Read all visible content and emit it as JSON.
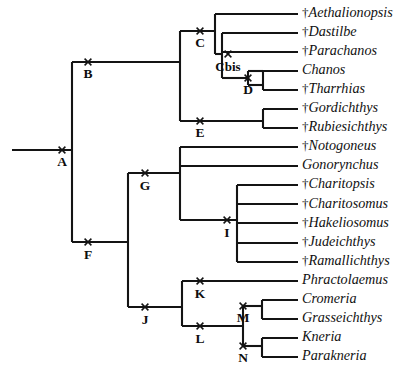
{
  "figure": {
    "type": "cladogram",
    "background_color": "#ffffff",
    "line_color": "#141414",
    "text_color": "#111111",
    "extinct_marker": "†",
    "extinct_marker_name": "dagger-icon",
    "node_marker": "x",
    "node_marker_name": "x-cross-icon",
    "tip_label_x": 302,
    "tip_line_end_x": 298,
    "first_tip_y": 14,
    "tip_spacing": 19.05
  },
  "taxa": [
    {
      "id": "aethalionopsis",
      "name": "Aethalionopsis",
      "extinct": true,
      "row": 0,
      "branch_x": 215
    },
    {
      "id": "dastilbe",
      "name": "Dastilbe",
      "extinct": true,
      "row": 1,
      "branch_x": 222
    },
    {
      "id": "parachanos",
      "name": "Parachanos",
      "extinct": true,
      "row": 2,
      "branch_x": 222
    },
    {
      "id": "chanos",
      "name": "Chanos",
      "extinct": false,
      "row": 3,
      "branch_x": 263
    },
    {
      "id": "tharrhias",
      "name": "Tharrhias",
      "extinct": true,
      "row": 4,
      "branch_x": 263
    },
    {
      "id": "gordichthys",
      "name": "Gordichthys",
      "extinct": true,
      "row": 5,
      "branch_x": 263
    },
    {
      "id": "rubiesichthys",
      "name": "Rubiesichthys",
      "extinct": true,
      "row": 6,
      "branch_x": 263
    },
    {
      "id": "notogoneus",
      "name": "Notogoneus",
      "extinct": true,
      "row": 7,
      "branch_x": 180
    },
    {
      "id": "gonorynchus",
      "name": "Gonorynchus",
      "extinct": false,
      "row": 8,
      "branch_x": 180
    },
    {
      "id": "charitopsis",
      "name": "Charitopsis",
      "extinct": true,
      "row": 9,
      "branch_x": 237
    },
    {
      "id": "charitosomus",
      "name": "Charitosomus",
      "extinct": true,
      "row": 10,
      "branch_x": 237
    },
    {
      "id": "hakeliosomus",
      "name": "Hakeliosomus",
      "extinct": true,
      "row": 11,
      "branch_x": 237
    },
    {
      "id": "judeichthys",
      "name": "Judeichthys",
      "extinct": true,
      "row": 12,
      "branch_x": 237
    },
    {
      "id": "ramallichthys",
      "name": "Ramallichthys",
      "extinct": true,
      "row": 13,
      "branch_x": 237
    },
    {
      "id": "phractolaemus",
      "name": "Phractolaemus",
      "extinct": false,
      "row": 14,
      "branch_x": 182
    },
    {
      "id": "cromeria",
      "name": "Cromeria",
      "extinct": false,
      "row": 15,
      "branch_x": 262
    },
    {
      "id": "grasseichthys",
      "name": "Grasseichthys",
      "extinct": false,
      "row": 16,
      "branch_x": 262
    },
    {
      "id": "kneria",
      "name": "Kneria",
      "extinct": false,
      "row": 17,
      "branch_x": 262
    },
    {
      "id": "parakneria",
      "name": "Parakneria",
      "extinct": false,
      "row": 18,
      "branch_x": 262
    }
  ],
  "nodes": [
    {
      "id": "A",
      "label": "A",
      "x": 72,
      "y": 150,
      "mark_x": 62,
      "label_dx": 0,
      "label_dy": 16
    },
    {
      "id": "B",
      "label": "B",
      "x": 72,
      "y": 62,
      "mark_x": 88,
      "label_dx": 16,
      "label_dy": 16
    },
    {
      "id": "C",
      "label": "C",
      "x": 180,
      "y": 31,
      "mark_x": 200,
      "label_dx": 20,
      "label_dy": 16
    },
    {
      "id": "Cbis",
      "label": "Cbis",
      "x": 222,
      "y": 54,
      "mark_x": 228,
      "label_dx": 6,
      "label_dy": 17,
      "wide": true
    },
    {
      "id": "D",
      "label": "D",
      "x": 248,
      "y": 78,
      "mark_x": 248,
      "label_dx": 0,
      "label_dy": 16
    },
    {
      "id": "E",
      "label": "E",
      "x": 180,
      "y": 121,
      "mark_x": 200,
      "label_dx": 20,
      "label_dy": 16
    },
    {
      "id": "F",
      "label": "F",
      "x": 128,
      "y": 242,
      "mark_x": 88,
      "label_dx": -40,
      "label_dy": 17
    },
    {
      "id": "G",
      "label": "G",
      "x": 145,
      "y": 173,
      "mark_x": 145,
      "label_dx": 0,
      "label_dy": 17
    },
    {
      "id": "I",
      "label": "I",
      "x": 237,
      "y": 220,
      "mark_x": 227,
      "label_dx": -10,
      "label_dy": 17
    },
    {
      "id": "J",
      "label": "J",
      "x": 145,
      "y": 307,
      "mark_x": 145,
      "label_dx": 0,
      "label_dy": 17
    },
    {
      "id": "K",
      "label": "K",
      "x": 182,
      "y": 281,
      "mark_x": 200,
      "label_dx": 18,
      "label_dy": 17
    },
    {
      "id": "L",
      "label": "L",
      "x": 182,
      "y": 326,
      "mark_x": 200,
      "label_dx": 18,
      "label_dy": 17
    },
    {
      "id": "M",
      "label": "M",
      "x": 243,
      "y": 306,
      "mark_x": 243,
      "label_dx": 0,
      "label_dy": 16
    },
    {
      "id": "N",
      "label": "N",
      "x": 243,
      "y": 346,
      "mark_x": 243,
      "label_dx": 0,
      "label_dy": 16
    }
  ],
  "edges": [
    {
      "id": "root-stem",
      "from": "root",
      "to": "A",
      "type": "h",
      "x1": 12,
      "x2": 72,
      "y": 150
    },
    {
      "id": "A-vertical",
      "from": "A",
      "to": "B-F",
      "type": "v",
      "x": 72,
      "y1": 62,
      "y2": 242
    },
    {
      "id": "B-stem",
      "from": "A",
      "to": "B",
      "type": "h",
      "x1": 72,
      "x2": 180,
      "y": 62
    },
    {
      "id": "B-vertical",
      "from": "B",
      "to": "C-E",
      "type": "v",
      "x": 180,
      "y1": 31,
      "y2": 121
    },
    {
      "id": "C-stem",
      "from": "B",
      "to": "C",
      "type": "h",
      "x1": 180,
      "x2": 215,
      "y": 31
    },
    {
      "id": "C-vertical",
      "from": "C",
      "to": "kids",
      "type": "v",
      "x": 215,
      "y1": 14,
      "y2": 54
    },
    {
      "id": "aethalionopsis-branch",
      "from": "C",
      "to": "aethalionopsis",
      "type": "h",
      "x1": 215,
      "x2": 298,
      "y": 14
    },
    {
      "id": "Cbis-stem",
      "from": "C",
      "to": "Cbis",
      "type": "h",
      "x1": 215,
      "x2": 222,
      "y": 54
    },
    {
      "id": "Cbis-vertical",
      "from": "Cbis",
      "to": "kids",
      "type": "v",
      "x": 222,
      "y1": 33,
      "y2": 78
    },
    {
      "id": "dastilbe-branch",
      "from": "Cbis",
      "to": "dastilbe",
      "type": "h",
      "x1": 222,
      "x2": 298,
      "y": 33
    },
    {
      "id": "parachanos-branch",
      "from": "Cbis",
      "to": "parachanos",
      "type": "h",
      "x1": 222,
      "x2": 298,
      "y": 52
    },
    {
      "id": "D-stem",
      "from": "Cbis",
      "to": "D",
      "type": "h",
      "x1": 222,
      "x2": 248,
      "y": 78
    },
    {
      "id": "D-vertical",
      "from": "D",
      "to": "kids",
      "type": "v",
      "x": 248,
      "y1": 71,
      "y2": 85
    },
    {
      "id": "D-bar-top",
      "from": "D",
      "to": "bar",
      "type": "h",
      "x1": 248,
      "x2": 263,
      "y": 71
    },
    {
      "id": "D-bar-bot",
      "from": "D",
      "to": "bar",
      "type": "h",
      "x1": 248,
      "x2": 263,
      "y": 85
    },
    {
      "id": "D-kids-vertical",
      "from": "D",
      "to": "kids",
      "type": "v",
      "x": 263,
      "y1": 71,
      "y2": 90
    },
    {
      "id": "chanos-branch",
      "from": "D",
      "to": "chanos",
      "type": "h",
      "x1": 263,
      "x2": 298,
      "y": 71
    },
    {
      "id": "tharrhias-branch",
      "from": "D",
      "to": "tharrhias",
      "type": "h",
      "x1": 263,
      "x2": 298,
      "y": 90
    },
    {
      "id": "E-stem",
      "from": "B",
      "to": "E",
      "type": "h",
      "x1": 180,
      "x2": 263,
      "y": 121
    },
    {
      "id": "E-vertical",
      "from": "E",
      "to": "kids",
      "type": "v",
      "x": 263,
      "y1": 109,
      "y2": 128
    },
    {
      "id": "gordichthys-branch",
      "from": "E",
      "to": "gordichthys",
      "type": "h",
      "x1": 263,
      "x2": 298,
      "y": 109
    },
    {
      "id": "rubiesichthys-branch",
      "from": "E",
      "to": "rubiesichthys",
      "type": "h",
      "x1": 263,
      "x2": 298,
      "y": 128
    },
    {
      "id": "F-stem",
      "from": "A",
      "to": "F",
      "type": "h",
      "x1": 72,
      "x2": 128,
      "y": 242
    },
    {
      "id": "F-vertical",
      "from": "F",
      "to": "G-J",
      "type": "v",
      "x": 128,
      "y1": 173,
      "y2": 307
    },
    {
      "id": "G-stem",
      "from": "F",
      "to": "G",
      "type": "h",
      "x1": 128,
      "x2": 180,
      "y": 173
    },
    {
      "id": "G-vertical",
      "from": "G",
      "to": "kids",
      "type": "v",
      "x": 180,
      "y1": 147,
      "y2": 220
    },
    {
      "id": "notogoneus-branch",
      "from": "G",
      "to": "notogoneus",
      "type": "h",
      "x1": 180,
      "x2": 298,
      "y": 147
    },
    {
      "id": "gonorynchus-branch",
      "from": "G",
      "to": "gonorynchus",
      "type": "h",
      "x1": 180,
      "x2": 298,
      "y": 166
    },
    {
      "id": "I-stem",
      "from": "G",
      "to": "I",
      "type": "h",
      "x1": 180,
      "x2": 237,
      "y": 220
    },
    {
      "id": "I-vertical",
      "from": "I",
      "to": "kids",
      "type": "v",
      "x": 237,
      "y1": 185,
      "y2": 262
    },
    {
      "id": "charitopsis-branch",
      "from": "I",
      "to": "charitopsis",
      "type": "h",
      "x1": 237,
      "x2": 298,
      "y": 185
    },
    {
      "id": "charitosomus-branch",
      "from": "I",
      "to": "charitosomus",
      "type": "h",
      "x1": 237,
      "x2": 298,
      "y": 204
    },
    {
      "id": "hakeliosomus-branch",
      "from": "I",
      "to": "hakeliosomus",
      "type": "h",
      "x1": 237,
      "x2": 298,
      "y": 223
    },
    {
      "id": "judeichthys-branch",
      "from": "I",
      "to": "judeichthys",
      "type": "h",
      "x1": 237,
      "x2": 298,
      "y": 243
    },
    {
      "id": "ramallichthys-branch",
      "from": "I",
      "to": "ramallichthys",
      "type": "h",
      "x1": 237,
      "x2": 298,
      "y": 262
    },
    {
      "id": "J-stem",
      "from": "F",
      "to": "J",
      "type": "h",
      "x1": 128,
      "x2": 182,
      "y": 307
    },
    {
      "id": "J-vertical",
      "from": "J",
      "to": "K-L",
      "type": "v",
      "x": 182,
      "y1": 281,
      "y2": 326
    },
    {
      "id": "phractolaemus-branch",
      "from": "K",
      "to": "phractolaemus",
      "type": "h",
      "x1": 182,
      "x2": 298,
      "y": 281
    },
    {
      "id": "L-stem",
      "from": "L",
      "to": "M-N",
      "type": "h",
      "x1": 182,
      "x2": 243,
      "y": 326
    },
    {
      "id": "L-vertical",
      "from": "L",
      "to": "M-N",
      "type": "v",
      "x": 243,
      "y1": 306,
      "y2": 346
    },
    {
      "id": "M-bar",
      "from": "M",
      "to": "kids",
      "type": "h",
      "x1": 243,
      "x2": 262,
      "y": 306
    },
    {
      "id": "M-vertical",
      "from": "M",
      "to": "kids",
      "type": "v",
      "x": 262,
      "y1": 300,
      "y2": 319
    },
    {
      "id": "cromeria-branch",
      "from": "M",
      "to": "cromeria",
      "type": "h",
      "x1": 262,
      "x2": 298,
      "y": 300
    },
    {
      "id": "grasseichthys-branch",
      "from": "M",
      "to": "grasseichthys",
      "type": "h",
      "x1": 262,
      "x2": 298,
      "y": 319
    },
    {
      "id": "N-bar",
      "from": "N",
      "to": "kids",
      "type": "h",
      "x1": 243,
      "x2": 262,
      "y": 346
    },
    {
      "id": "N-vertical",
      "from": "N",
      "to": "kids",
      "type": "v",
      "x": 262,
      "y1": 338,
      "y2": 357
    },
    {
      "id": "kneria-branch",
      "from": "N",
      "to": "kneria",
      "type": "h",
      "x1": 262,
      "x2": 298,
      "y": 338
    },
    {
      "id": "parakneria-branch",
      "from": "N",
      "to": "parakneria",
      "type": "h",
      "x1": 262,
      "x2": 298,
      "y": 357
    }
  ]
}
